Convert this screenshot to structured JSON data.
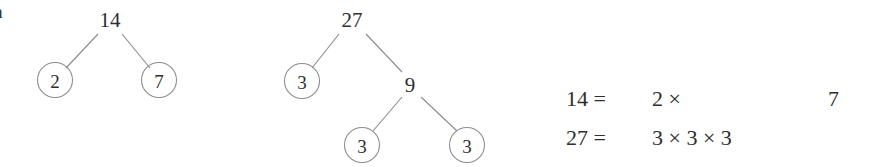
{
  "figure": {
    "problem_label": "a",
    "background_color": "#ffffff",
    "ink_color": "#2e2e2e",
    "stroke_color": "#8d8d92"
  },
  "trees": [
    {
      "id": "factor-tree-14",
      "root": {
        "value": "14",
        "circled": false,
        "x": 110,
        "y": 20
      },
      "nodes": [
        {
          "value": "2",
          "circled": true,
          "x": 55,
          "y": 80
        },
        {
          "value": "7",
          "circled": true,
          "x": 159,
          "y": 80
        }
      ],
      "edges": [
        {
          "x1": 98,
          "y1": 34,
          "x2": 66,
          "y2": 68
        },
        {
          "x1": 122,
          "y1": 34,
          "x2": 150,
          "y2": 68
        }
      ]
    },
    {
      "id": "factor-tree-27",
      "root": {
        "value": "27",
        "circled": false,
        "x": 352,
        "y": 20
      },
      "nodes": [
        {
          "value": "3",
          "circled": true,
          "x": 302,
          "y": 81
        },
        {
          "value": "9",
          "circled": false,
          "x": 410,
          "y": 85
        },
        {
          "value": "3",
          "circled": true,
          "x": 362,
          "y": 145
        },
        {
          "value": "3",
          "circled": true,
          "x": 467,
          "y": 145
        }
      ],
      "edges": [
        {
          "x1": 339,
          "y1": 34,
          "x2": 312,
          "y2": 68
        },
        {
          "x1": 366,
          "y1": 34,
          "x2": 402,
          "y2": 72
        },
        {
          "x1": 402,
          "y1": 97,
          "x2": 373,
          "y2": 131
        },
        {
          "x1": 421,
          "y1": 97,
          "x2": 457,
          "y2": 131
        }
      ],
      "node_radius": 17.5
    }
  ],
  "equations": [
    {
      "id": "equation-14",
      "lhs": "14 =",
      "mid": "2 ×",
      "tail": "7",
      "full": "14 = 2 ×      7"
    },
    {
      "id": "equation-27",
      "lhs": "27 =",
      "mid": "3 × 3 × 3",
      "tail": "",
      "full": "27 =   3 × 3 × 3"
    }
  ]
}
